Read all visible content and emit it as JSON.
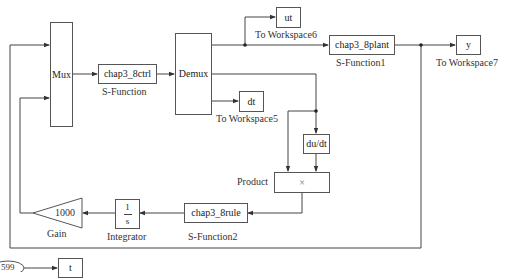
{
  "diagram": {
    "type": "simulink-block-diagram",
    "blocks": {
      "mux": {
        "text": "Mux"
      },
      "ctrl": {
        "text": "chap3_8ctrl",
        "caption": "S-Function"
      },
      "demux": {
        "text": "Demux"
      },
      "ut": {
        "text": "ut",
        "caption": "To Workspace6"
      },
      "plant": {
        "text": "chap3_8plant",
        "caption": "S-Function1"
      },
      "y": {
        "text": "y",
        "caption": "To Workspace7"
      },
      "dt": {
        "text": "dt",
        "caption": "To Workspace5"
      },
      "dudt": {
        "text": "du/dt"
      },
      "product": {
        "text": "×",
        "caption": "Product"
      },
      "rule": {
        "text": "chap3_8rule",
        "caption": "S-Function2"
      },
      "integrator": {
        "numerator": "1",
        "denominator": "s",
        "caption": "Integrator"
      },
      "gain": {
        "text": "1000",
        "caption": "Gain"
      },
      "clock": {
        "text": "599"
      },
      "t": {
        "text": "t"
      }
    },
    "colors": {
      "line": "#444444",
      "block_border": "#555555",
      "background": "#ffffff"
    }
  }
}
